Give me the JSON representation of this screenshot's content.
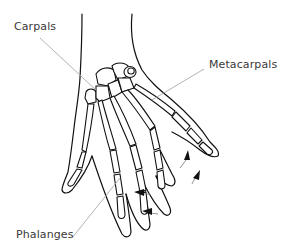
{
  "diagram": {
    "labels": [
      {
        "id": "carpals",
        "text": "Carpals"
      },
      {
        "id": "metacarpals",
        "text": "Metacarpals"
      },
      {
        "id": "phalanges",
        "text": "Phalanges"
      }
    ],
    "arrows_count": 4,
    "colors": {
      "outline": "#111111",
      "leader_line": "#aaaaaa",
      "label_text": "#3a3a3a",
      "background": "#ffffff"
    }
  }
}
